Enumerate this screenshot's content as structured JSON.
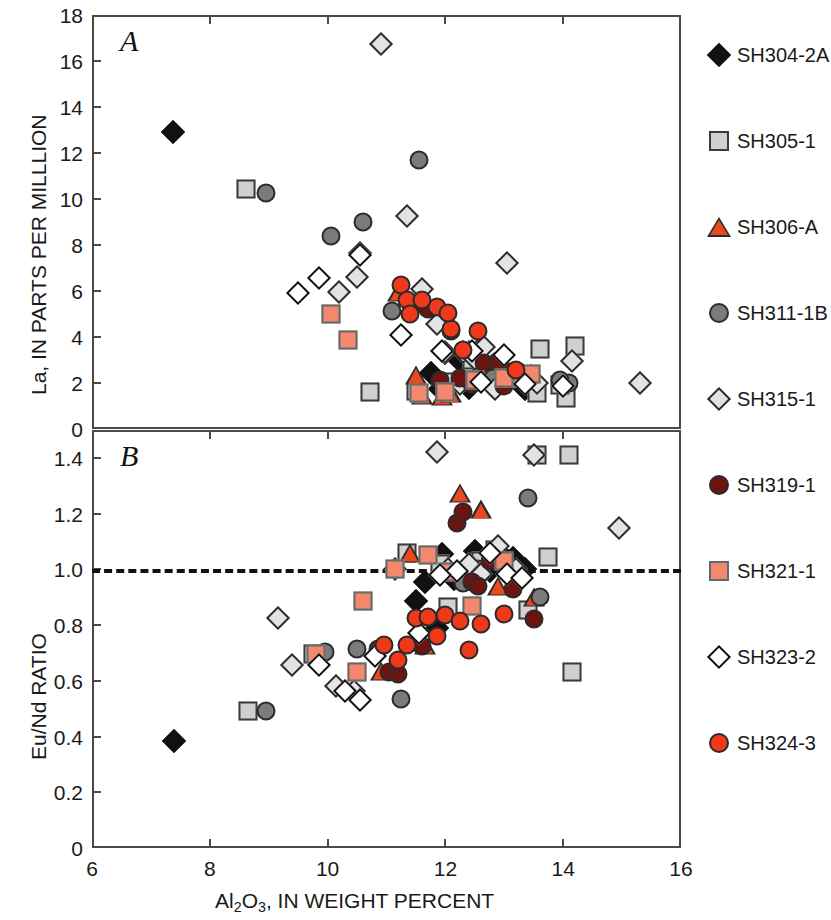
{
  "figure": {
    "panel_a_letter": "A",
    "panel_b_letter": "B",
    "xlabel_prefix": "Al",
    "xlabel_sub1": "2",
    "xlabel_mid": "O",
    "xlabel_sub2": "3",
    "xlabel_suffix": ", IN WEIGHT PERCENT",
    "ylabel_a": "La, IN PARTS PER MILLLION",
    "ylabel_b": "Eu/Nd RATIO"
  },
  "legend": {
    "position": "right",
    "items": [
      {
        "label": "SH304-2A",
        "shape": "diamond",
        "fill": "#111111",
        "edge": "#111111"
      },
      {
        "label": "SH305-1",
        "shape": "square",
        "fill": "#d0d0d0",
        "edge": "#3c3c3c"
      },
      {
        "label": "SH306-A",
        "shape": "triangle",
        "fill": "#e8491f",
        "edge": "#2b2b2b"
      },
      {
        "label": "SH311-1B",
        "shape": "circle",
        "fill": "#7b7b7b",
        "edge": "#2b2b2b"
      },
      {
        "label": "SH315-1",
        "shape": "diamond",
        "fill": "#e3e3e3",
        "edge": "#2b2b2b"
      },
      {
        "label": "SH319-1",
        "shape": "circle",
        "fill": "#6d1410",
        "edge": "#2b2b2b"
      },
      {
        "label": "SH321-1",
        "shape": "square",
        "fill": "#f4876c",
        "edge": "#5a7070"
      },
      {
        "label": "SH323-2",
        "shape": "diamond",
        "fill": "#ffffff",
        "edge": "#111111"
      },
      {
        "label": "SH324-3",
        "shape": "circle",
        "fill": "#f0381b",
        "edge": "#2b2b2b"
      }
    ]
  },
  "chart_data": [
    {
      "type": "scatter",
      "panel": "A",
      "title": "A",
      "xlabel": "Al2O3, IN WEIGHT PERCENT",
      "ylabel": "La, IN PARTS PER MILLLION",
      "xlim": [
        6,
        16
      ],
      "ylim": [
        0,
        18
      ],
      "xticks": [
        6,
        8,
        10,
        12,
        14,
        16
      ],
      "yticks": [
        0,
        2,
        4,
        6,
        8,
        10,
        12,
        14,
        16,
        18
      ],
      "grid": false,
      "legend_position": "right outside",
      "series": [
        {
          "name": "SH304-2A",
          "points": [
            [
              7.38,
              12.9
            ],
            [
              11.75,
              2.45
            ],
            [
              12.0,
              3.3
            ],
            [
              12.25,
              2.95
            ],
            [
              12.55,
              3.4
            ],
            [
              12.72,
              2.2
            ],
            [
              12.9,
              2.05
            ],
            [
              13.15,
              2.3
            ],
            [
              13.35,
              1.75
            ],
            [
              13.5,
              1.9
            ],
            [
              12.4,
              1.8
            ],
            [
              11.9,
              1.75
            ]
          ]
        },
        {
          "name": "SH305-1",
          "points": [
            [
              8.62,
              10.45
            ],
            [
              10.72,
              1.6
            ],
            [
              11.5,
              1.65
            ],
            [
              12.05,
              2.05
            ],
            [
              12.45,
              3.0
            ],
            [
              12.35,
              2.15
            ],
            [
              12.9,
              2.4
            ],
            [
              13.25,
              2.2
            ],
            [
              13.55,
              1.55
            ],
            [
              13.6,
              3.5
            ],
            [
              14.05,
              1.35
            ],
            [
              14.2,
              3.6
            ],
            [
              13.95,
              1.9
            ]
          ]
        },
        {
          "name": "SH306-A",
          "points": [
            [
              11.2,
              5.95
            ],
            [
              11.5,
              2.35
            ],
            [
              11.6,
              1.5
            ],
            [
              12.4,
              3.5
            ],
            [
              12.85,
              2.6
            ],
            [
              13.45,
              2.45
            ],
            [
              11.95,
              1.45
            ],
            [
              12.1,
              1.55
            ]
          ]
        },
        {
          "name": "SH311-1B",
          "points": [
            [
              8.95,
              10.25
            ],
            [
              10.05,
              8.4
            ],
            [
              10.6,
              9.0
            ],
            [
              11.55,
              11.7
            ],
            [
              11.1,
              5.15
            ],
            [
              12.6,
              2.45
            ],
            [
              12.8,
              2.2
            ],
            [
              13.25,
              2.5
            ],
            [
              13.4,
              2.1
            ],
            [
              14.1,
              2.0
            ],
            [
              13.95,
              2.15
            ]
          ]
        },
        {
          "name": "SH315-1",
          "points": [
            [
              10.9,
              16.75
            ],
            [
              10.55,
              7.65
            ],
            [
              10.2,
              5.95
            ],
            [
              10.5,
              6.6
            ],
            [
              11.35,
              9.25
            ],
            [
              11.6,
              6.1
            ],
            [
              11.85,
              4.55
            ],
            [
              12.0,
              3.35
            ],
            [
              12.3,
              3.35
            ],
            [
              12.5,
              3.05
            ],
            [
              12.65,
              3.55
            ],
            [
              12.25,
              1.95
            ],
            [
              12.85,
              1.75
            ],
            [
              13.55,
              2.0
            ],
            [
              14.15,
              2.95
            ],
            [
              15.3,
              2.0
            ],
            [
              13.05,
              7.2
            ]
          ]
        },
        {
          "name": "SH319-1",
          "points": [
            [
              11.45,
              5.35
            ],
            [
              11.7,
              5.2
            ],
            [
              12.1,
              4.25
            ],
            [
              12.65,
              2.85
            ],
            [
              12.9,
              2.95
            ],
            [
              13.1,
              2.5
            ],
            [
              13.0,
              1.85
            ],
            [
              12.45,
              1.95
            ],
            [
              11.9,
              2.15
            ],
            [
              12.25,
              2.2
            ]
          ]
        },
        {
          "name": "SH321-1",
          "points": [
            [
              10.05,
              5.0
            ],
            [
              10.35,
              3.85
            ],
            [
              11.55,
              1.55
            ],
            [
              12.0,
              1.6
            ],
            [
              12.5,
              2.15
            ],
            [
              13.0,
              2.2
            ],
            [
              13.3,
              2.2
            ],
            [
              13.45,
              2.4
            ]
          ]
        },
        {
          "name": "SH323-2",
          "points": [
            [
              9.5,
              5.9
            ],
            [
              9.85,
              6.55
            ],
            [
              10.55,
              7.55
            ],
            [
              11.25,
              4.1
            ],
            [
              11.95,
              3.4
            ],
            [
              12.45,
              3.4
            ],
            [
              12.6,
              2.05
            ],
            [
              13.0,
              3.2
            ],
            [
              13.35,
              1.95
            ],
            [
              14.0,
              1.85
            ]
          ]
        },
        {
          "name": "SH324-3",
          "points": [
            [
              11.25,
              6.25
            ],
            [
              11.35,
              5.6
            ],
            [
              11.4,
              5.0
            ],
            [
              11.85,
              5.3
            ],
            [
              12.1,
              4.35
            ],
            [
              12.55,
              4.25
            ],
            [
              12.05,
              5.05
            ],
            [
              12.3,
              3.45
            ],
            [
              13.2,
              2.55
            ],
            [
              11.6,
              5.6
            ]
          ]
        }
      ]
    },
    {
      "type": "scatter",
      "panel": "B",
      "title": "B",
      "xlabel": "Al2O3, IN WEIGHT PERCENT",
      "ylabel": "Eu/Nd RATIO",
      "xlim": [
        6,
        16
      ],
      "ylim": [
        0,
        1.5
      ],
      "xticks": [
        6,
        8,
        10,
        12,
        14,
        16
      ],
      "yticks": [
        0,
        0.2,
        0.4,
        0.6,
        0.8,
        1.0,
        1.2,
        1.4
      ],
      "grid": false,
      "reference_line": {
        "y": 1.0,
        "style": "dashed",
        "color": "#111111"
      },
      "legend_position": "right outside",
      "series": [
        {
          "name": "SH304-2A",
          "points": [
            [
              7.4,
              0.385
            ],
            [
              11.65,
              0.955
            ],
            [
              11.95,
              1.055
            ],
            [
              12.5,
              1.065
            ],
            [
              12.75,
              0.995
            ],
            [
              12.95,
              1.055
            ],
            [
              13.15,
              1.04
            ],
            [
              11.5,
              0.885
            ],
            [
              12.15,
              0.965
            ],
            [
              12.35,
              1.0
            ],
            [
              13.35,
              1.0
            ],
            [
              11.85,
              0.79
            ]
          ]
        },
        {
          "name": "SH305-1",
          "points": [
            [
              8.65,
              0.49
            ],
            [
              11.35,
              1.06
            ],
            [
              11.9,
              1.02
            ],
            [
              12.05,
              0.865
            ],
            [
              12.6,
              1.03
            ],
            [
              12.85,
              1.07
            ],
            [
              13.4,
              0.855
            ],
            [
              13.55,
              1.41
            ],
            [
              14.1,
              1.41
            ],
            [
              14.15,
              0.63
            ],
            [
              13.75,
              1.045
            ],
            [
              9.75,
              0.695
            ]
          ]
        },
        {
          "name": "SH306-A",
          "points": [
            [
              12.25,
              1.275
            ],
            [
              12.6,
              1.215
            ],
            [
              11.4,
              1.06
            ],
            [
              12.2,
              0.995
            ],
            [
              12.9,
              0.94
            ],
            [
              13.5,
              0.9
            ],
            [
              10.9,
              0.635
            ],
            [
              11.65,
              0.73
            ]
          ]
        },
        {
          "name": "SH311-1B",
          "points": [
            [
              8.95,
              0.49
            ],
            [
              9.95,
              0.705
            ],
            [
              11.25,
              0.535
            ],
            [
              12.3,
              0.95
            ],
            [
              13.4,
              1.255
            ],
            [
              13.6,
              0.9
            ],
            [
              10.5,
              0.715
            ],
            [
              12.55,
              1.0
            ],
            [
              12.0,
              0.99
            ]
          ]
        },
        {
          "name": "SH315-1",
          "points": [
            [
              9.4,
              0.655
            ],
            [
              9.15,
              0.825
            ],
            [
              10.15,
              0.58
            ],
            [
              10.45,
              0.565
            ],
            [
              11.15,
              1.0
            ],
            [
              11.85,
              1.42
            ],
            [
              12.05,
              1.0
            ],
            [
              12.4,
              1.02
            ],
            [
              12.9,
              1.085
            ],
            [
              13.2,
              1.0
            ],
            [
              12.6,
              0.985
            ],
            [
              13.5,
              1.41
            ],
            [
              14.95,
              1.15
            ]
          ]
        },
        {
          "name": "SH319-1",
          "points": [
            [
              10.85,
              0.715
            ],
            [
              11.05,
              0.63
            ],
            [
              11.2,
              0.625
            ],
            [
              11.6,
              0.725
            ],
            [
              12.2,
              1.165
            ],
            [
              12.3,
              1.205
            ],
            [
              12.45,
              0.955
            ],
            [
              12.75,
              1.03
            ],
            [
              13.15,
              0.93
            ],
            [
              13.5,
              0.82
            ],
            [
              12.55,
              0.94
            ]
          ]
        },
        {
          "name": "SH321-1",
          "points": [
            [
              9.8,
              0.695
            ],
            [
              10.6,
              0.885
            ],
            [
              11.15,
              1.0
            ],
            [
              11.7,
              1.05
            ],
            [
              12.05,
              0.99
            ],
            [
              12.45,
              0.87
            ],
            [
              13.0,
              1.03
            ],
            [
              10.5,
              0.63
            ]
          ]
        },
        {
          "name": "SH323-2",
          "points": [
            [
              9.85,
              0.655
            ],
            [
              10.3,
              0.565
            ],
            [
              10.55,
              0.53
            ],
            [
              11.55,
              0.77
            ],
            [
              12.2,
              0.995
            ],
            [
              12.75,
              1.06
            ],
            [
              13.05,
              0.985
            ],
            [
              13.3,
              0.97
            ],
            [
              11.9,
              0.98
            ],
            [
              10.8,
              0.69
            ]
          ]
        },
        {
          "name": "SH324-3",
          "points": [
            [
              10.95,
              0.73
            ],
            [
              11.2,
              0.675
            ],
            [
              11.35,
              0.73
            ],
            [
              11.5,
              0.825
            ],
            [
              11.7,
              0.83
            ],
            [
              11.85,
              0.76
            ],
            [
              12.0,
              0.835
            ],
            [
              12.25,
              0.815
            ],
            [
              12.6,
              0.805
            ],
            [
              13.0,
              0.84
            ],
            [
              12.4,
              0.71
            ]
          ]
        }
      ]
    }
  ]
}
